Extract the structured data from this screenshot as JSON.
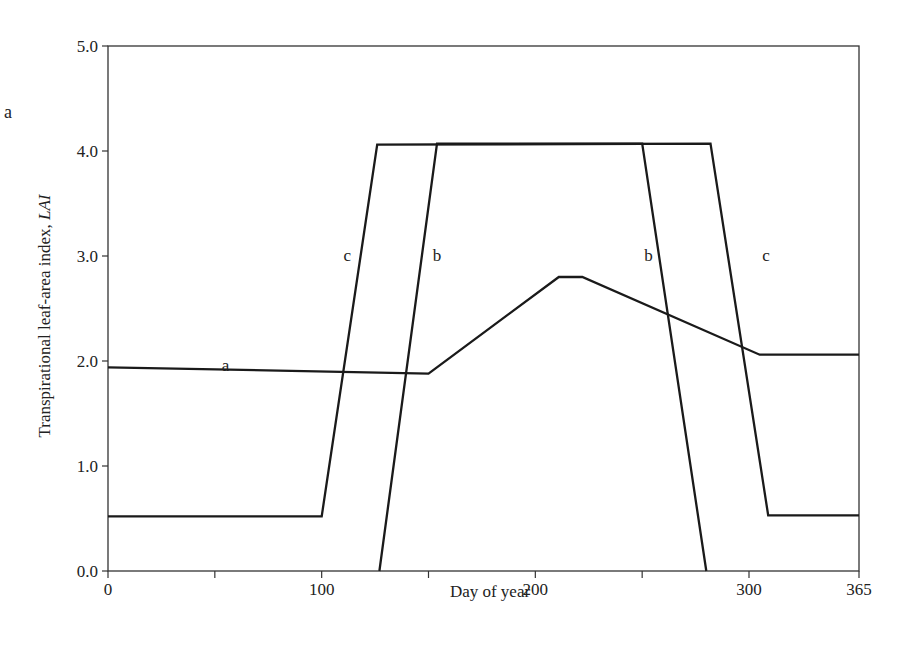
{
  "panel_label": "a",
  "chart_data": {
    "type": "line",
    "title": "",
    "xlabel": "Day of year",
    "ylabel": "Transpirational leaf-area index, LAI",
    "xlim": [
      0,
      365
    ],
    "ylim": [
      0.0,
      5.0
    ],
    "x_ticks": [
      0,
      50,
      100,
      150,
      200,
      250,
      300,
      365
    ],
    "x_tick_labels": [
      "0",
      "",
      "100",
      "",
      "200",
      "",
      "300",
      "365"
    ],
    "y_ticks": [
      0.0,
      1.0,
      2.0,
      3.0,
      4.0,
      5.0
    ],
    "y_tick_labels": [
      "0.0",
      "1.0",
      "2.0",
      "3.0",
      "4.0",
      "5.0"
    ],
    "grid": false,
    "legend": "none (inline curve labels)",
    "series": [
      {
        "name": "a",
        "x": [
          0,
          150,
          211,
          222,
          305,
          365
        ],
        "y": [
          1.94,
          1.88,
          2.8,
          2.8,
          2.06,
          2.06
        ]
      },
      {
        "name": "b",
        "x": [
          127,
          154,
          250,
          280
        ],
        "y": [
          0.0,
          4.07,
          4.07,
          0.0
        ]
      },
      {
        "name": "c",
        "x": [
          0,
          100,
          126,
          282,
          309,
          365
        ],
        "y": [
          0.52,
          0.52,
          4.06,
          4.07,
          0.53,
          0.53
        ]
      }
    ],
    "annotations": [
      {
        "text": "a",
        "x": 55,
        "y": 1.95
      },
      {
        "text": "c",
        "x": 112,
        "y": 3.0
      },
      {
        "text": "b",
        "x": 154,
        "y": 3.0
      },
      {
        "text": "b",
        "x": 253,
        "y": 3.0
      },
      {
        "text": "c",
        "x": 308,
        "y": 3.0
      }
    ]
  }
}
